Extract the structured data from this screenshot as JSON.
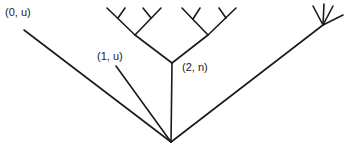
{
  "diagram": {
    "type": "tree",
    "colors": {
      "stroke": "#1a1a1a",
      "background": "#ffffff"
    },
    "root": {
      "x": 171,
      "y": 142
    },
    "labels": [
      {
        "id": "node-0-u",
        "text": "(0, u)",
        "x": 5,
        "y": 6
      },
      {
        "id": "node-1-u",
        "text": "(1, u)",
        "x": 97,
        "y": 50
      },
      {
        "id": "node-2-n",
        "text": "(2, n)",
        "x": 182,
        "y": 61
      }
    ],
    "edges": [
      {
        "name": "branch-0-u",
        "x1": 171,
        "y1": 142,
        "x2": 24,
        "y2": 30
      },
      {
        "name": "branch-1-u",
        "x1": 171,
        "y1": 142,
        "x2": 116,
        "y2": 66
      },
      {
        "name": "branch-2-n-stem",
        "x1": 171,
        "y1": 142,
        "x2": 172,
        "y2": 63
      },
      {
        "name": "branch-right-long",
        "x1": 171,
        "y1": 142,
        "x2": 323,
        "y2": 25
      },
      {
        "name": "subtree-left-trunk",
        "x1": 172,
        "y1": 63,
        "x2": 135,
        "y2": 35
      },
      {
        "name": "subtree-right-trunk",
        "x1": 172,
        "y1": 63,
        "x2": 208,
        "y2": 35
      },
      {
        "name": "sl-left-arm",
        "x1": 135,
        "y1": 35,
        "x2": 107,
        "y2": 8
      },
      {
        "name": "sl-left-twig",
        "x1": 118,
        "y1": 18,
        "x2": 125,
        "y2": 8
      },
      {
        "name": "sl-right-arm",
        "x1": 135,
        "y1": 35,
        "x2": 161,
        "y2": 8
      },
      {
        "name": "sl-right-twig",
        "x1": 151,
        "y1": 18,
        "x2": 143,
        "y2": 8
      },
      {
        "name": "sr-left-arm",
        "x1": 208,
        "y1": 35,
        "x2": 182,
        "y2": 8
      },
      {
        "name": "sr-left-twig",
        "x1": 193,
        "y1": 19,
        "x2": 200,
        "y2": 8
      },
      {
        "name": "sr-right-arm",
        "x1": 208,
        "y1": 35,
        "x2": 236,
        "y2": 8
      },
      {
        "name": "sr-right-twig",
        "x1": 226,
        "y1": 18,
        "x2": 219,
        "y2": 8
      },
      {
        "name": "fan-spike-1",
        "x1": 323,
        "y1": 25,
        "x2": 313,
        "y2": 6
      },
      {
        "name": "fan-spike-2",
        "x1": 323,
        "y1": 25,
        "x2": 324,
        "y2": 4
      },
      {
        "name": "fan-spike-3",
        "x1": 323,
        "y1": 25,
        "x2": 333,
        "y2": 6
      },
      {
        "name": "fan-spike-4",
        "x1": 323,
        "y1": 25,
        "x2": 343,
        "y2": 15
      }
    ]
  }
}
